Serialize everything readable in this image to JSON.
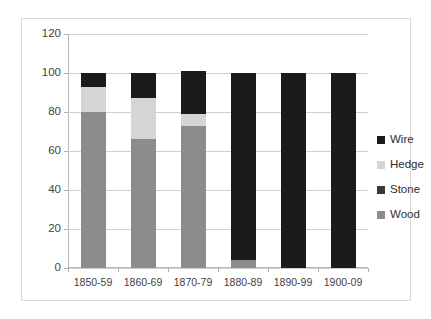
{
  "chart_data": {
    "type": "bar",
    "subtype": "stacked-bar",
    "title": "",
    "xlabel": "",
    "ylabel": "",
    "categories": [
      "1850-59",
      "1860-69",
      "1870-79",
      "1880-89",
      "1890-99",
      "1900-09"
    ],
    "series": [
      {
        "name": "Wood",
        "values": [
          80,
          66,
          73,
          4,
          0,
          0
        ],
        "color": "#8c8c8c"
      },
      {
        "name": "Stone",
        "values": [
          0,
          0,
          0,
          0,
          0,
          0
        ],
        "color": "#3a3a3a"
      },
      {
        "name": "Hedge",
        "values": [
          13,
          21,
          6,
          0,
          0,
          0
        ],
        "color": "#d5d5d5"
      },
      {
        "name": "Wire",
        "values": [
          7,
          13,
          22,
          96,
          100,
          100
        ],
        "color": "#1b1b1b"
      }
    ],
    "stack_order": [
      "Wood",
      "Stone",
      "Hedge",
      "Wire"
    ],
    "ylim": [
      0,
      120
    ],
    "yticks": [
      0,
      20,
      40,
      60,
      80,
      100,
      120
    ],
    "ytick_labels": [
      "0",
      "20",
      "40",
      "60",
      "80",
      "100",
      "120"
    ],
    "grid": true,
    "grid_axis": "y",
    "legend_position": "right",
    "legend": [
      {
        "label": "Wire",
        "color": "#1b1b1b"
      },
      {
        "label": "Hedge",
        "color": "#d5d5d5"
      },
      {
        "label": "Stone",
        "color": "#3a3a3a"
      },
      {
        "label": "Wood",
        "color": "#8c8c8c"
      }
    ],
    "bar_totals": [
      100,
      100,
      101,
      100,
      100,
      100
    ]
  }
}
